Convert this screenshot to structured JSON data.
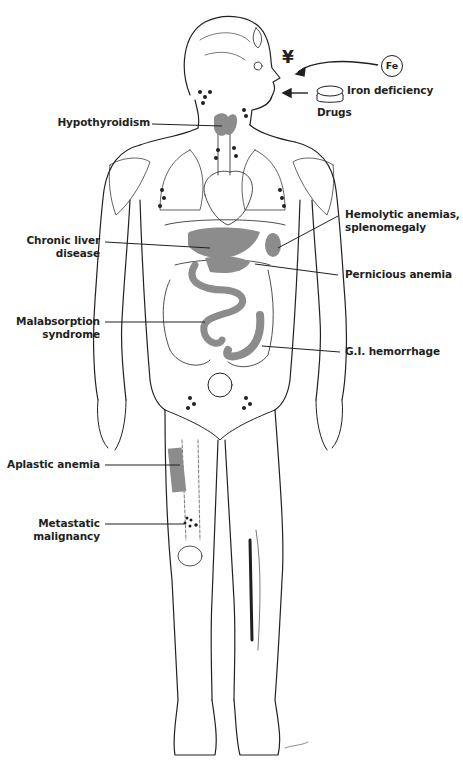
{
  "figure": {
    "type": "anatomical line drawing, anterior view of human body",
    "highlight_color": "#8c8c8c",
    "line_color": "#231f20",
    "background": "#ffffff"
  },
  "inputs": {
    "iron": {
      "symbol": "Fe",
      "label": "Iron deficiency"
    },
    "drugs": {
      "label": "Drugs",
      "pill_text": "Rx"
    },
    "yen_symbol": "¥"
  },
  "labels": {
    "hypothyroidism": "Hypothyroidism",
    "chronic_liver_1": "Chronic liver",
    "chronic_liver_2": "disease",
    "hemolytic_1": "Hemolytic anemias,",
    "hemolytic_2": "splenomegaly",
    "pernicious": "Pernicious anemia",
    "malabsorption_1": "Malabsorption",
    "malabsorption_2": "syndrome",
    "gi_hemorrhage": "G.I. hemorrhage",
    "aplastic": "Aplastic anemia",
    "metastatic_1": "Metastatic",
    "metastatic_2": "malignancy"
  }
}
